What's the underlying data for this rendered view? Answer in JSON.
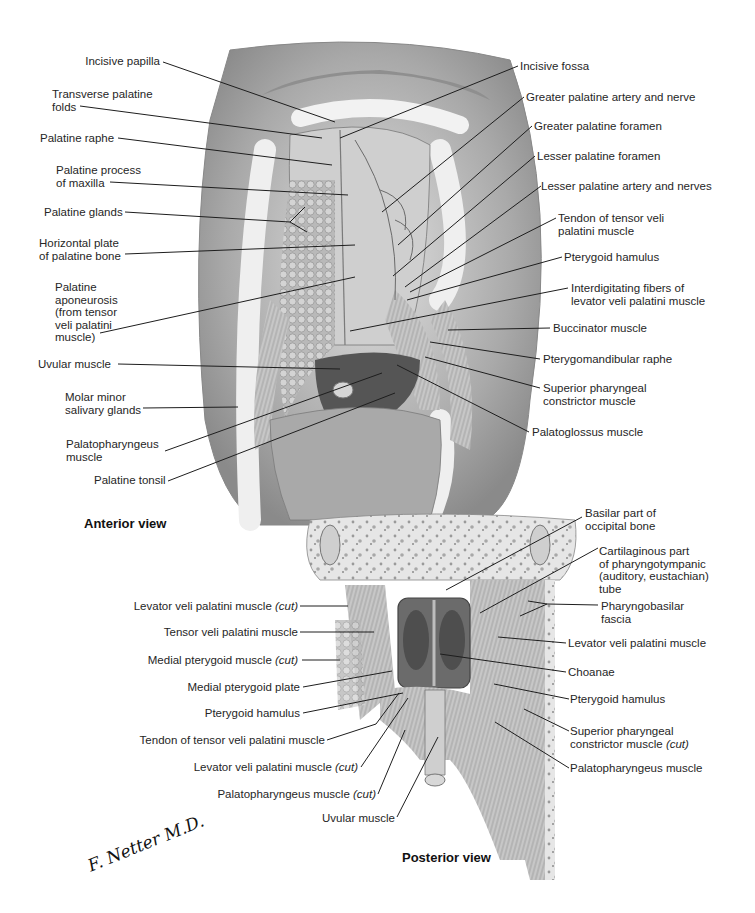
{
  "figure": {
    "anterior": {
      "title": "Anterior view",
      "left_labels": [
        {
          "text": "Incisive papilla"
        },
        {
          "text": "Transverse palatine\nfolds"
        },
        {
          "text": "Palatine raphe"
        },
        {
          "text": "Palatine process\nof maxilla"
        },
        {
          "text": "Palatine glands"
        },
        {
          "text": "Horizontal plate\nof palatine bone"
        },
        {
          "text": "Palatine\naponeurosis\n(from tensor\nveli palatini\nmuscle)"
        },
        {
          "text": "Uvular muscle"
        },
        {
          "text": "Molar minor\nsalivary glands"
        },
        {
          "text": "Palatopharyngeus\nmuscle"
        },
        {
          "text": "Palatine tonsil"
        }
      ],
      "right_labels": [
        {
          "text": "Incisive fossa"
        },
        {
          "text": "Greater palatine artery and nerve"
        },
        {
          "text": "Greater palatine foramen"
        },
        {
          "text": "Lesser palatine foramen"
        },
        {
          "text": "Lesser palatine artery and nerves"
        },
        {
          "text": "Tendon of tensor veli\npalatini muscle"
        },
        {
          "text": "Pterygoid hamulus"
        },
        {
          "text": "Interdigitating fibers of\nlevator veli palatini muscle"
        },
        {
          "text": "Buccinator muscle"
        },
        {
          "text": "Pterygomandibular raphe"
        },
        {
          "text": "Superior pharyngeal\nconstrictor muscle"
        },
        {
          "text": "Palatoglossus muscle"
        }
      ]
    },
    "posterior": {
      "title": "Posterior view",
      "left_labels": [
        {
          "text": "Levator veli palatini muscle",
          "cut": "(cut)"
        },
        {
          "text": "Tensor veli palatini muscle",
          "cut": ""
        },
        {
          "text": "Medial pterygoid muscle",
          "cut": "(cut)"
        },
        {
          "text": "Medial pterygoid plate",
          "cut": ""
        },
        {
          "text": "Pterygoid hamulus",
          "cut": ""
        },
        {
          "text": "Tendon of tensor veli palatini muscle",
          "cut": ""
        },
        {
          "text": "Levator veli palatini muscle",
          "cut": "(cut)"
        },
        {
          "text": "Palatopharyngeus muscle",
          "cut": "(cut)"
        },
        {
          "text": "Uvular muscle",
          "cut": ""
        }
      ],
      "right_labels": [
        {
          "text": "Basilar part of\noccipital bone",
          "cut": ""
        },
        {
          "text": "Cartilaginous part\nof pharyngotympanic\n(auditory, eustachian)\ntube",
          "cut": ""
        },
        {
          "text": "Pharyngobasilar\nfascia",
          "cut": ""
        },
        {
          "text": "Levator veli palatini muscle",
          "cut": ""
        },
        {
          "text": "Choanae",
          "cut": ""
        },
        {
          "text": "Pterygoid hamulus",
          "cut": ""
        },
        {
          "text": "Superior pharyngeal\nconstrictor muscle",
          "cut": "(cut)"
        },
        {
          "text": "Palatopharyngeus muscle",
          "cut": ""
        }
      ]
    },
    "signature": "F. Netter M.D.",
    "colors": {
      "ink": "#262626",
      "tissue_light": "#d9d9d9",
      "tissue_mid": "#a8a8a8",
      "tissue_dark": "#6e6e6e",
      "background": "#ffffff"
    }
  }
}
